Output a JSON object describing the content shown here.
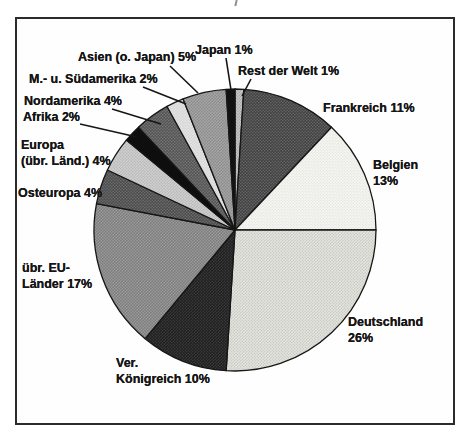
{
  "figure": {
    "background": "#ffffff",
    "border_color": "#2b2b2b",
    "text_color": "#161616"
  },
  "chart_data": {
    "type": "pie",
    "title": "",
    "start_angle_deg": 0,
    "direction": "clockwise",
    "center": [
      235,
      230
    ],
    "radius": 141,
    "outline": "#161616",
    "legend_position": "none",
    "slices": [
      {
        "label": "Rest der Welt",
        "value": 1,
        "slug": "rest-der-welt",
        "bg": "#c6c6c6",
        "dot": "#a9a9a9",
        "dot_r": 0.8
      },
      {
        "label": "Frankreich",
        "value": 11,
        "slug": "frankreich",
        "bg": "#414141",
        "dot": "#666666",
        "dot_r": 0.8
      },
      {
        "label": "Belgien",
        "value": 13,
        "slug": "belgien",
        "bg": "#f5f5f1",
        "dot": "#dcdcd6",
        "dot_r": 0.55
      },
      {
        "label": "Deutschland",
        "value": 26,
        "slug": "deutschland",
        "bg": "#e4e4df",
        "dot": "#c3c3bd",
        "dot_r": 0.65
      },
      {
        "label": "Ver. Königreich",
        "value": 10,
        "slug": "ver-koenigreich",
        "bg": "#202020",
        "dot": "#404040",
        "dot_r": 0.7
      },
      {
        "label": "übr. EU-Länder",
        "value": 17,
        "slug": "uebr-eu-laender",
        "bg": "#9b9b9b",
        "dot": "#7c7c7c",
        "dot_r": 0.9
      },
      {
        "label": "Osteuropa",
        "value": 4,
        "slug": "osteuropa",
        "bg": "#4b4b4b",
        "dot": "#6e6e6e",
        "dot_r": 0.8
      },
      {
        "label": "Europa (übr. Länd.)",
        "value": 4,
        "slug": "europa-uebr-laend",
        "bg": "#d0d0d0",
        "dot": "#b4b4b4",
        "dot_r": 0.75
      },
      {
        "label": "Afrika",
        "value": 2,
        "slug": "afrika",
        "bg": "#0e0e0e",
        "dot": null,
        "dot_r": 0
      },
      {
        "label": "Nordamerika",
        "value": 4,
        "slug": "nordamerika",
        "bg": "#545454",
        "dot": "#767676",
        "dot_r": 0.8
      },
      {
        "label": "M.- u. Südamerika",
        "value": 2,
        "slug": "m-u-suedamerika",
        "bg": "#e2e2e2",
        "dot": "#cacaca",
        "dot_r": 0.6
      },
      {
        "label": "Asien (o. Japan)",
        "value": 5,
        "slug": "asien-o-japan",
        "bg": "#a6a6a6",
        "dot": "#8b8b8b",
        "dot_r": 0.85
      },
      {
        "label": "Japan",
        "value": 1,
        "slug": "japan",
        "bg": "#121212",
        "dot": null,
        "dot_r": 0
      }
    ],
    "labels": [
      {
        "slug": "japan",
        "lines": [
          "Japan 1%"
        ],
        "x": 195,
        "y": 43
      },
      {
        "slug": "rest-der-welt",
        "lines": [
          "Rest der Welt 1%"
        ],
        "x": 238,
        "y": 64
      },
      {
        "slug": "asien-o-japan",
        "lines": [
          "Asien (o. Japan) 5%"
        ],
        "x": 78,
        "y": 50
      },
      {
        "slug": "m-u-suedamerika",
        "lines": [
          "M.- u. Südamerika 2%"
        ],
        "x": 29,
        "y": 72
      },
      {
        "slug": "nordamerika",
        "lines": [
          "Nordamerika 4%"
        ],
        "x": 24,
        "y": 94
      },
      {
        "slug": "afrika",
        "lines": [
          "Afrika 2%"
        ],
        "x": 23,
        "y": 110
      },
      {
        "slug": "europa-uebr-laend",
        "lines": [
          "Europa",
          "(übr. Länd.) 4%"
        ],
        "x": 21,
        "y": 138
      },
      {
        "slug": "osteuropa",
        "lines": [
          "Osteuropa 4%"
        ],
        "x": 18,
        "y": 186
      },
      {
        "slug": "uebr-eu-laender",
        "lines": [
          "übr. EU-",
          "Länder 17%"
        ],
        "x": 22,
        "y": 261
      },
      {
        "slug": "ver-koenigreich",
        "lines": [
          "Ver.",
          "Königreich 10%"
        ],
        "x": 116,
        "y": 356
      },
      {
        "slug": "deutschland",
        "lines": [
          "Deutschland",
          "26%"
        ],
        "x": 348,
        "y": 315
      },
      {
        "slug": "belgien",
        "lines": [
          "Belgien",
          "13%"
        ],
        "x": 373,
        "y": 158
      },
      {
        "slug": "frankreich",
        "lines": [
          "Frankreich 11%"
        ],
        "x": 323,
        "y": 101
      }
    ],
    "leader_lines": [
      {
        "slug": "japan",
        "x1": 226,
        "y1": 58,
        "x2": 231,
        "y2": 90
      },
      {
        "slug": "rest-der-welt",
        "x1": 251,
        "y1": 79,
        "x2": 242,
        "y2": 96
      },
      {
        "slug": "asien-o-japan",
        "x1": 170,
        "y1": 66,
        "x2": 198,
        "y2": 93
      },
      {
        "slug": "m-u-suedamerika",
        "x1": 143,
        "y1": 87,
        "x2": 186,
        "y2": 104
      },
      {
        "slug": "nordamerika",
        "x1": 112,
        "y1": 109,
        "x2": 161,
        "y2": 124
      },
      {
        "slug": "afrika",
        "x1": 80,
        "y1": 124,
        "x2": 137,
        "y2": 137
      }
    ]
  }
}
